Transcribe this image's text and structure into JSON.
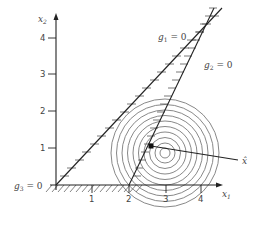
{
  "figure": {
    "type": "constrained-optimization-diagram",
    "axes": {
      "x_label": "x",
      "x_sub": "1",
      "y_label": "x",
      "y_sub": "2",
      "x_ticks": [
        "1",
        "2",
        "3",
        "4"
      ],
      "y_ticks": [
        "1",
        "2",
        "3",
        "4"
      ]
    },
    "constraints": [
      {
        "id": "g1",
        "label": "g",
        "sub": "1",
        "eq": " = 0"
      },
      {
        "id": "g2",
        "label": "g",
        "sub": "2",
        "eq": " = 0"
      },
      {
        "id": "g3",
        "label": "g",
        "sub": "3",
        "eq": " = 0"
      }
    ],
    "optimum": {
      "label": "x̂"
    },
    "contours": {
      "count": 10,
      "center": [
        3,
        1
      ]
    },
    "colors": {
      "line": "#222222",
      "contour": "#777777",
      "hatch": "#555555",
      "text": "#444444"
    }
  }
}
